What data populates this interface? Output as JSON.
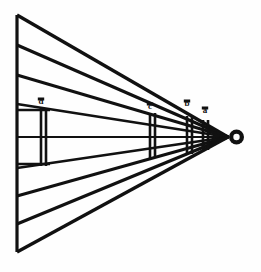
{
  "figure": {
    "background_color": "#fefefe",
    "ink_color": "#111111"
  },
  "geometry": {
    "picture_plane": {
      "label": "left-vertical-edge",
      "x": 17,
      "y_top": 15,
      "y_bottom": 252,
      "stroke_width": 3.2
    },
    "apex": {
      "label": "eye-point",
      "x": 228,
      "y": 137
    },
    "eye_ring": {
      "cx": 236.5,
      "cy": 137,
      "r_outer": 7.5,
      "r_inner": 3.2
    },
    "rays": [
      {
        "name": "ray-top-1",
        "left_y": 15,
        "stroke_width": 3.4
      },
      {
        "name": "ray-top-2",
        "left_y": 45,
        "stroke_width": 3.2
      },
      {
        "name": "ray-top-3",
        "left_y": 75,
        "stroke_width": 3.0
      },
      {
        "name": "ray-top-4",
        "left_y": 104,
        "stroke_width": 2.6
      },
      {
        "name": "ray-axis",
        "left_y": 137,
        "stroke_width": 2.2
      },
      {
        "name": "ray-bottom-4",
        "left_y": 168,
        "stroke_width": 2.6
      },
      {
        "name": "ray-bottom-3",
        "left_y": 196,
        "stroke_width": 3.0
      },
      {
        "name": "ray-bottom-2",
        "left_y": 224,
        "stroke_width": 3.2
      },
      {
        "name": "ray-bottom-1",
        "left_y": 252,
        "stroke_width": 3.4
      }
    ],
    "transversals": [
      {
        "name": "transversal-d",
        "label": "d",
        "x_front": 41,
        "x_back": 46,
        "y_top": 108,
        "y_bottom": 166,
        "label_x": 41,
        "label_y": 104,
        "stroke_width": 2.6
      },
      {
        "name": "transversal-c",
        "label": "c",
        "x_front": 150,
        "x_back": 155,
        "y_top": 113,
        "y_bottom": 158,
        "label_x": 150,
        "label_y": 109,
        "stroke_width": 2.6
      },
      {
        "name": "transversal-b",
        "label": "b",
        "x_front": 187,
        "x_back": 192,
        "y_top": 116,
        "y_bottom": 154,
        "label_x": 187,
        "label_y": 106,
        "stroke_width": 2.6
      },
      {
        "name": "transversal-a",
        "label": "a",
        "x_front": 203,
        "x_back": 208,
        "y_top": 120,
        "y_bottom": 150,
        "label_x": 205,
        "label_y": 113,
        "stroke_width": 2.6
      }
    ],
    "cross_bars": [
      {
        "name": "cross-bar-upper",
        "x_start": 17,
        "x_end": 50,
        "y": 110,
        "stroke_width": 2.6
      },
      {
        "name": "cross-bar-lower",
        "x_start": 17,
        "x_end": 50,
        "y": 164,
        "stroke_width": 2.6
      }
    ]
  },
  "labels": {
    "d": "d",
    "c": "c",
    "b": "b",
    "a": "a"
  }
}
